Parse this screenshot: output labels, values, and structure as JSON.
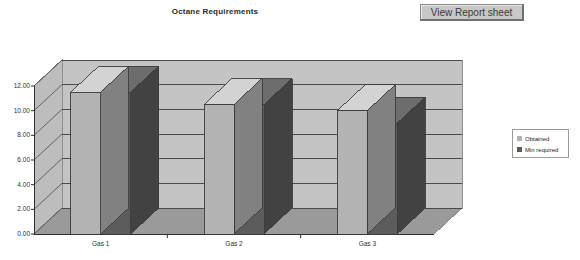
{
  "window": {
    "background": "#ffffff"
  },
  "button": {
    "label": "View Report sheet",
    "name": "view-report-sheet-button"
  },
  "chart_data": {
    "type": "bar",
    "title": "Octane Requirements",
    "xlabel": "",
    "ylabel": "",
    "categories": [
      "Gas 1",
      "Gas 2",
      "Gas 3"
    ],
    "series": [
      {
        "name": "Obtained",
        "values": [
          11.5,
          10.5,
          10.0
        ],
        "color": "#b3b3b3"
      },
      {
        "name": "Min required",
        "values": [
          11.5,
          10.5,
          9.0
        ],
        "color": "#5c5c5c"
      }
    ],
    "ylim": [
      0,
      12
    ],
    "ytick_values": [
      0.0,
      2.0,
      4.0,
      6.0,
      8.0,
      10.0,
      12.0
    ],
    "ytick_labels": [
      "0.00",
      "2.00",
      "4.00",
      "6.00",
      "8.00",
      "10.00",
      "12.00"
    ],
    "grid": true,
    "legend_position": "right",
    "style": "3d-clustered-column",
    "wall_color": "#c4c4c4",
    "floor_color": "#9a9a9a",
    "gridline_color": "#4a4a4a"
  }
}
